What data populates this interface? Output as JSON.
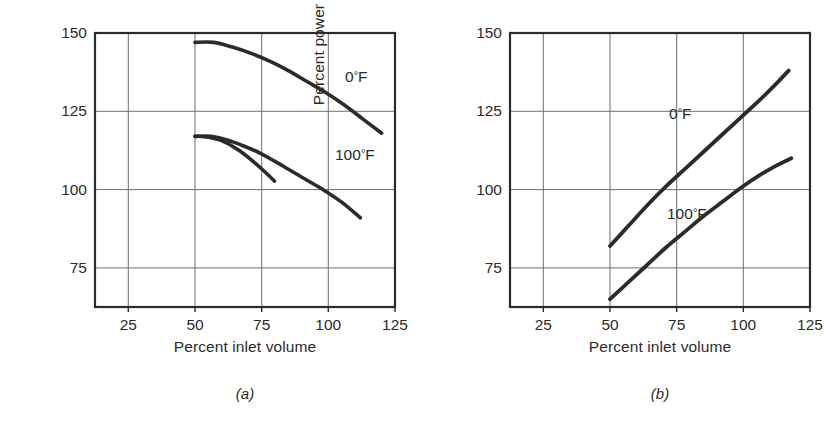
{
  "figure": {
    "panels": [
      {
        "caption": "(a)",
        "xlabel": "Percent inlet volume",
        "ylabel": "Percent pressure rise",
        "xticks": [
          "25",
          "50",
          "75",
          "100",
          "125"
        ],
        "yticks": [
          "150",
          "125",
          "100",
          "75"
        ],
        "series_labels": [
          {
            "text": "0",
            "deg": "°",
            "unit": "F"
          },
          {
            "text": "100",
            "deg": "°",
            "unit": "F"
          }
        ]
      },
      {
        "caption": "(b)",
        "xlabel": "Percent inlet volume",
        "ylabel": "Percent power",
        "xticks": [
          "25",
          "50",
          "75",
          "100",
          "125"
        ],
        "yticks": [
          "150",
          "125",
          "100",
          "75"
        ],
        "series_labels": [
          {
            "text": "0",
            "deg": "°",
            "unit": "F"
          },
          {
            "text": "100",
            "deg": "°",
            "unit": "F"
          }
        ]
      }
    ]
  },
  "chart_data": [
    {
      "type": "line",
      "title": "(a)",
      "xlabel": "Percent inlet volume",
      "ylabel": "Percent pressure rise",
      "xlim": [
        12.5,
        125
      ],
      "ylim": [
        62.5,
        150
      ],
      "xticks": [
        25,
        50,
        75,
        100,
        125
      ],
      "yticks": [
        75,
        100,
        125,
        150
      ],
      "grid": true,
      "legend": "inline-annotation",
      "series": [
        {
          "name": "0° F",
          "x": [
            50,
            57,
            64,
            71,
            78,
            85,
            92,
            99,
            106,
            113,
            120
          ],
          "y": [
            147,
            147,
            145.5,
            143.5,
            141,
            138,
            134.5,
            131,
            127,
            122.5,
            118
          ]
        },
        {
          "name": "100° F",
          "x": [
            50,
            56,
            62,
            68,
            74,
            80,
            86,
            92,
            98,
            105,
            112
          ],
          "y": [
            117,
            117,
            115.8,
            114,
            111.8,
            109,
            106,
            103,
            100,
            96,
            91
          ]
        }
      ]
    },
    {
      "type": "line",
      "title": "(b)",
      "xlabel": "Percent inlet volume",
      "ylabel": "Percent power",
      "xlim": [
        12.5,
        125
      ],
      "ylim": [
        62.5,
        150
      ],
      "xticks": [
        25,
        50,
        75,
        100,
        125
      ],
      "yticks": [
        75,
        100,
        125,
        150
      ],
      "grid": true,
      "legend": "inline-annotation",
      "series": [
        {
          "name": "0° F",
          "x": [
            50,
            57,
            64,
            71,
            78,
            85,
            92,
            99,
            106,
            112,
            117
          ],
          "y": [
            82,
            88.5,
            95,
            101,
            106.5,
            112,
            117.5,
            123,
            128.5,
            133.5,
            138
          ]
        },
        {
          "name": "100° F",
          "x": [
            50,
            57,
            64,
            71,
            78,
            85,
            92,
            99,
            106,
            112,
            118
          ],
          "y": [
            65,
            70.5,
            76,
            81.5,
            86.5,
            91.5,
            96,
            100.5,
            104.5,
            107.5,
            110
          ]
        }
      ]
    }
  ],
  "colors": {
    "curve": "#2b2b2b",
    "grid": "#6e6e6e",
    "axis": "#2b2b2b",
    "text": "#2b2b2b",
    "background": "#ffffff"
  }
}
